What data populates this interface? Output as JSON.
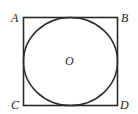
{
  "figure": {
    "type": "geometry",
    "rectangle": {
      "vertices": [
        "A",
        "B",
        "D",
        "C"
      ]
    },
    "circle": {
      "center_label": "O"
    },
    "labels": {
      "A": "A",
      "B": "B",
      "C": "C",
      "D": "D",
      "O": "O"
    },
    "stroke_color": "#2a2a2a"
  }
}
